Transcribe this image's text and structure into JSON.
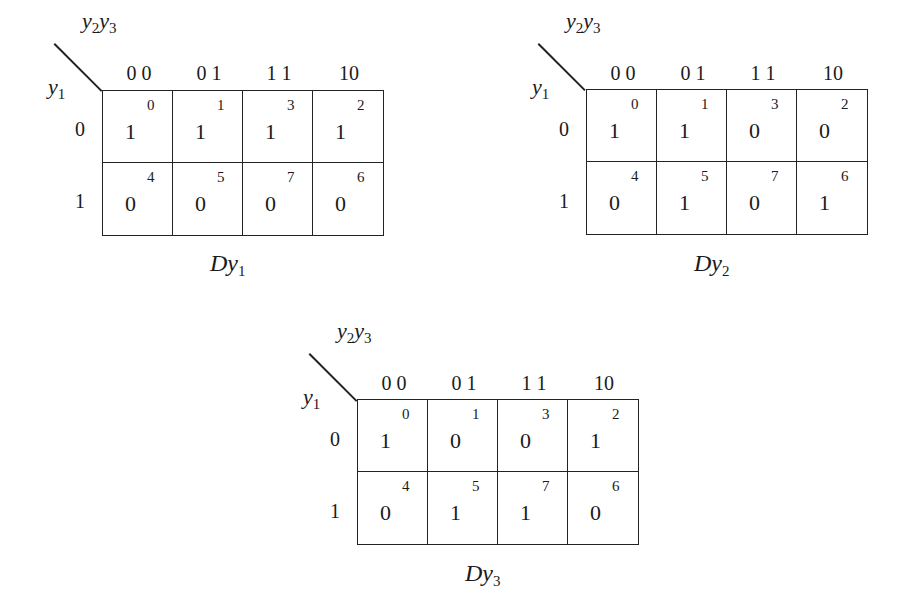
{
  "figure": {
    "col_var": {
      "base1": "y",
      "sub1": "2",
      "base2": "y",
      "sub2": "3"
    },
    "row_var": {
      "base": "y",
      "sub": "1"
    },
    "col_headers": [
      "0 0",
      "0 1",
      "1 1",
      "10"
    ],
    "row_headers": [
      "0",
      "1"
    ],
    "cell_indices": [
      [
        "0",
        "1",
        "3",
        "2"
      ],
      [
        "4",
        "5",
        "7",
        "6"
      ]
    ],
    "maps": [
      {
        "title_base": "Dy",
        "title_sub": "1",
        "values": [
          [
            "1",
            "1",
            "1",
            "1"
          ],
          [
            "0",
            "0",
            "0",
            "0"
          ]
        ]
      },
      {
        "title_base": "Dy",
        "title_sub": "2",
        "values": [
          [
            "1",
            "1",
            "0",
            "0"
          ],
          [
            "0",
            "1",
            "0",
            "1"
          ]
        ]
      },
      {
        "title_base": "Dy",
        "title_sub": "3",
        "values": [
          [
            "1",
            "0",
            "0",
            "1"
          ],
          [
            "0",
            "1",
            "1",
            "0"
          ]
        ]
      }
    ]
  }
}
